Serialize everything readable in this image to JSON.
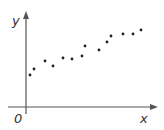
{
  "chart_data": {
    "type": "scatter",
    "title": "",
    "xlabel": "x",
    "ylabel": "y",
    "origin_label": "0",
    "grid": false,
    "legend": null,
    "points": [
      {
        "x": 30,
        "y": 75
      },
      {
        "x": 34,
        "y": 69
      },
      {
        "x": 45,
        "y": 61
      },
      {
        "x": 53,
        "y": 66
      },
      {
        "x": 63,
        "y": 58
      },
      {
        "x": 72,
        "y": 59
      },
      {
        "x": 82,
        "y": 56
      },
      {
        "x": 85,
        "y": 46
      },
      {
        "x": 99,
        "y": 50
      },
      {
        "x": 107,
        "y": 42
      },
      {
        "x": 111,
        "y": 36
      },
      {
        "x": 123,
        "y": 34
      },
      {
        "x": 133,
        "y": 34
      },
      {
        "x": 141,
        "y": 30
      }
    ],
    "note": "Point coordinates are pixel positions; axes are unlabeled (no tick values)."
  },
  "colors": {
    "axis": "#555555",
    "point": "#222222"
  }
}
